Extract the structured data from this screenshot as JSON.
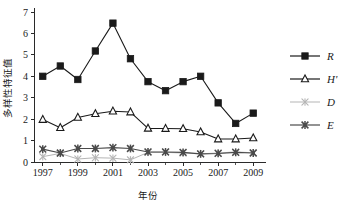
{
  "chart_data": {
    "type": "line",
    "title": "",
    "xlabel": "年份",
    "ylabel": "多样性特征值",
    "x": [
      1997,
      1998,
      1999,
      2000,
      2001,
      2002,
      2003,
      2004,
      2005,
      2006,
      2007,
      2008,
      2009
    ],
    "xtick_labels": [
      "1997",
      "1999",
      "2001",
      "2003",
      "2005",
      "2007",
      "2009"
    ],
    "xtick_values": [
      1997,
      1999,
      2001,
      2003,
      2005,
      2007,
      2009
    ],
    "ytick_labels": [
      "0",
      "1",
      "2",
      "3",
      "4",
      "5",
      "6",
      "7"
    ],
    "ytick_values": [
      0,
      1,
      2,
      3,
      4,
      5,
      6,
      7
    ],
    "xlim": [
      1996.5,
      2009.5
    ],
    "ylim": [
      0,
      7
    ],
    "grid": false,
    "legend_position": "right",
    "series": [
      {
        "name": "R",
        "marker": "filled-square",
        "color": "#1a1a1a",
        "values": [
          4.0,
          4.48,
          3.85,
          5.18,
          6.48,
          4.82,
          3.75,
          3.33,
          3.75,
          4.0,
          2.76,
          1.8,
          2.28
        ]
      },
      {
        "name": "H'",
        "marker": "open-triangle",
        "color": "#1a1a1a",
        "values": [
          1.98,
          1.6,
          2.08,
          2.25,
          2.37,
          2.33,
          1.57,
          1.56,
          1.55,
          1.4,
          1.07,
          1.07,
          1.12
        ]
      },
      {
        "name": "D",
        "marker": "gray-cross",
        "color": "#b5b5b5",
        "values": [
          0.25,
          0.4,
          0.14,
          0.2,
          0.18,
          0.1,
          0.45,
          0.45,
          0.42,
          0.38,
          0.42,
          0.47,
          0.43
        ]
      },
      {
        "name": "E",
        "marker": "dark-star",
        "color": "#4a4a4a",
        "values": [
          0.6,
          0.42,
          0.63,
          0.63,
          0.67,
          0.63,
          0.47,
          0.47,
          0.45,
          0.38,
          0.4,
          0.45,
          0.42
        ]
      }
    ]
  },
  "legend": {
    "entries": [
      {
        "label": "R"
      },
      {
        "label": "H'"
      },
      {
        "label": "D"
      },
      {
        "label": "E"
      }
    ]
  },
  "colors": {
    "axis": "#2a2a2a",
    "series_r": "#1a1a1a",
    "series_h": "#1a1a1a",
    "series_d": "#b5b5b5",
    "series_e": "#4a4a4a",
    "background": "#ffffff"
  }
}
